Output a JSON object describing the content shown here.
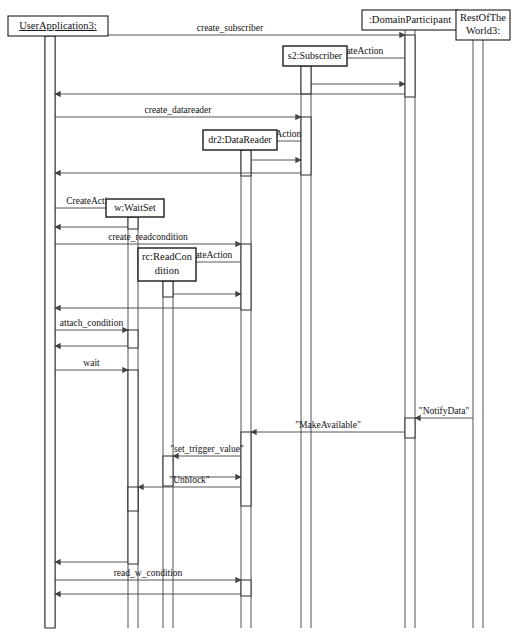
{
  "diagram": {
    "kind": "uml-sequence-diagram",
    "title": "",
    "caption": "",
    "ink_color": "#1a1a1a",
    "line_color": "#555555",
    "background": "#ffffff"
  },
  "lifelines": [
    {
      "id": "user",
      "label": "UserApplication3:",
      "underlined": true,
      "x": 50,
      "box": {
        "x": 8,
        "y": 16,
        "w": 100,
        "h": 20
      },
      "bottom": 628
    },
    {
      "id": "sub",
      "label": "s2:Subscriber",
      "underlined": false,
      "x": 306,
      "box": {
        "x": 283,
        "y": 46,
        "w": 64,
        "h": 20
      },
      "bottom": 628,
      "created": true
    },
    {
      "id": "reader",
      "label": "dr2:DataReader",
      "underlined": false,
      "x": 246,
      "box": {
        "x": 203,
        "y": 130,
        "w": 74,
        "h": 20
      },
      "bottom": 628,
      "created": true
    },
    {
      "id": "waitset",
      "label": "w:WaitSet",
      "underlined": false,
      "x": 133,
      "box": {
        "x": 106,
        "y": 199,
        "w": 58,
        "h": 18
      },
      "bottom": 628,
      "created": true
    },
    {
      "id": "rc",
      "label": "rc:ReadCon dition",
      "label_line1": "rc:ReadCon",
      "label_line2": "dition",
      "underlined": false,
      "x": 168,
      "box": {
        "x": 138,
        "y": 248,
        "w": 58,
        "h": 33
      },
      "bottom": 628,
      "created": true
    },
    {
      "id": "dp",
      "label": ":DomainParticipant",
      "underlined": false,
      "x": 410,
      "box": {
        "x": 362,
        "y": 10,
        "w": 96,
        "h": 20
      },
      "bottom": 628
    },
    {
      "id": "rest",
      "label": "RestOfThe World3:",
      "label_line1": "RestOfThe",
      "label_line2": "World3:",
      "underlined": false,
      "x": 478,
      "box": {
        "x": 456,
        "y": 10,
        "w": 54,
        "h": 30
      },
      "bottom": 628
    }
  ],
  "messages": [
    {
      "id": "m1",
      "label": "create_subscriber",
      "from": "user",
      "to": "dp",
      "y": 35,
      "dir": "rtl-source-left"
    },
    {
      "id": "m2",
      "label": "CreateAction",
      "from": "dp",
      "to": "sub",
      "y": 58,
      "dir": "right-to-left"
    },
    {
      "id": "m3",
      "label": "",
      "from": "sub",
      "to": "dp",
      "y": 84,
      "dir": "left-to-right"
    },
    {
      "id": "m4",
      "label": "",
      "from": "dp",
      "to": "user",
      "y": 94,
      "dir": "right-to-left"
    },
    {
      "id": "m5",
      "label": "create_datareader",
      "from": "user",
      "to": "sub",
      "y": 117,
      "dir": "left-to-right"
    },
    {
      "id": "m6",
      "label": "CreateAction",
      "from": "sub",
      "to": "reader",
      "y": 141,
      "dir": "right-to-left"
    },
    {
      "id": "m7",
      "label": "",
      "from": "reader",
      "to": "sub",
      "y": 160,
      "dir": "left-to-right"
    },
    {
      "id": "m8",
      "label": "",
      "from": "sub",
      "to": "user",
      "y": 173,
      "dir": "right-to-left"
    },
    {
      "id": "m9",
      "label": "CreateAction",
      "from": "user",
      "to": "waitset",
      "y": 208,
      "dir": "left-to-right"
    },
    {
      "id": "m10",
      "label": "",
      "from": "waitset",
      "to": "user",
      "y": 227,
      "dir": "right-to-left"
    },
    {
      "id": "m11",
      "label": "create_readcondition",
      "from": "user",
      "to": "reader",
      "y": 244,
      "dir": "left-to-right"
    },
    {
      "id": "m12",
      "label": "CreateAction",
      "from": "reader",
      "to": "rc",
      "y": 262,
      "dir": "right-to-left"
    },
    {
      "id": "m13",
      "label": "",
      "from": "rc",
      "to": "reader",
      "y": 294,
      "dir": "left-to-right"
    },
    {
      "id": "m14",
      "label": "",
      "from": "reader",
      "to": "user",
      "y": 308,
      "dir": "right-to-left"
    },
    {
      "id": "m15",
      "label": "attach_condition",
      "from": "user",
      "to": "waitset",
      "y": 330,
      "dir": "left-to-right"
    },
    {
      "id": "m16",
      "label": "",
      "from": "waitset",
      "to": "user",
      "y": 346,
      "dir": "right-to-left"
    },
    {
      "id": "m17",
      "label": "wait",
      "from": "user",
      "to": "waitset",
      "y": 370,
      "dir": "left-to-right"
    },
    {
      "id": "m18",
      "label": "\"NotifyData\"",
      "from": "rest",
      "to": "dp",
      "y": 418,
      "dir": "right-to-left"
    },
    {
      "id": "m19",
      "label": "\"MakeAvailable\"",
      "from": "dp",
      "to": "reader",
      "y": 432,
      "dir": "right-to-left"
    },
    {
      "id": "m20",
      "label": "\"set_trigger_value\"",
      "from": "reader",
      "to": "rc",
      "y": 456,
      "dir": "right-to-left"
    },
    {
      "id": "m21",
      "label": "",
      "from": "rc",
      "to": "reader",
      "y": 477,
      "dir": "left-to-right"
    },
    {
      "id": "m22",
      "label": "\"Unblock\"",
      "from": "reader",
      "to": "waitset",
      "y": 487,
      "dir": "right-to-left"
    },
    {
      "id": "m23",
      "label": "",
      "from": "waitset",
      "to": "user",
      "y": 562,
      "dir": "right-to-left"
    },
    {
      "id": "m24",
      "label": "read_w_condition",
      "from": "user",
      "to": "reader",
      "y": 580,
      "dir": "left-to-right"
    },
    {
      "id": "m25",
      "label": "",
      "from": "reader",
      "to": "user",
      "y": 594,
      "dir": "right-to-left"
    }
  ],
  "activations": [
    {
      "id": "a-user-main",
      "lifeline": "user",
      "x": 45,
      "y": 36,
      "w": 10,
      "h": 592
    },
    {
      "id": "a-dp-1",
      "lifeline": "dp",
      "x": 405,
      "y": 35,
      "w": 10,
      "h": 62
    },
    {
      "id": "a-sub-1",
      "lifeline": "sub",
      "x": 301,
      "y": 66,
      "w": 10,
      "h": 28
    },
    {
      "id": "a-sub-2",
      "lifeline": "sub",
      "x": 301,
      "y": 117,
      "w": 10,
      "h": 58
    },
    {
      "id": "a-reader-1",
      "lifeline": "reader",
      "x": 241,
      "y": 150,
      "w": 10,
      "h": 26
    },
    {
      "id": "a-waitset-1",
      "lifeline": "waitset",
      "x": 128,
      "y": 217,
      "w": 10,
      "h": 12
    },
    {
      "id": "a-reader-2",
      "lifeline": "reader",
      "x": 241,
      "y": 244,
      "w": 10,
      "h": 66
    },
    {
      "id": "a-rc-1",
      "lifeline": "rc",
      "x": 163,
      "y": 281,
      "w": 10,
      "h": 16
    },
    {
      "id": "a-waitset-2",
      "lifeline": "waitset",
      "x": 128,
      "y": 330,
      "w": 10,
      "h": 18
    },
    {
      "id": "a-waitset-3",
      "lifeline": "waitset",
      "x": 128,
      "y": 370,
      "w": 10,
      "h": 194
    },
    {
      "id": "a-dp-2",
      "lifeline": "dp",
      "x": 405,
      "y": 418,
      "w": 10,
      "h": 20
    },
    {
      "id": "a-reader-3",
      "lifeline": "reader",
      "x": 241,
      "y": 432,
      "w": 10,
      "h": 74
    },
    {
      "id": "a-rc-2",
      "lifeline": "rc",
      "x": 163,
      "y": 456,
      "w": 10,
      "h": 30
    },
    {
      "id": "a-waitset-4",
      "lifeline": "waitset",
      "x": 128,
      "y": 487,
      "w": 10,
      "h": 24
    },
    {
      "id": "a-reader-4",
      "lifeline": "reader",
      "x": 241,
      "y": 580,
      "w": 10,
      "h": 16
    }
  ]
}
